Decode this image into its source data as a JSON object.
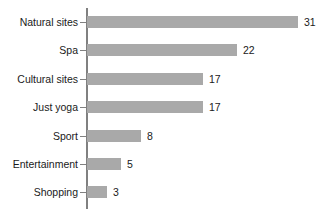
{
  "chart_data": {
    "type": "bar",
    "orientation": "horizontal",
    "title": "",
    "subtitle": "",
    "xlabel": "",
    "ylabel": "",
    "categories": [
      "Natural sites",
      "Spa",
      "Cultural sites",
      "Just yoga",
      "Sport",
      "Entertainment",
      "Shopping"
    ],
    "values": [
      31,
      22,
      17,
      17,
      8,
      5,
      3
    ],
    "value_labels": [
      "31",
      "22",
      "17",
      "17",
      "8",
      "5",
      "3"
    ],
    "xlim": [
      0,
      31
    ],
    "ylim": null,
    "grid": false,
    "legend": null,
    "legend_position": "none",
    "bar_color": "#a9a9a9",
    "axis_color": "#808080",
    "text_color": "#1a1a1a",
    "background": "#ffffff",
    "tick_labels_x": [],
    "tick_labels_y": [
      "Natural sites",
      "Spa",
      "Cultural sites",
      "Just yoga",
      "Sport",
      "Entertainment",
      "Shopping"
    ],
    "annotations": []
  },
  "layout": {
    "axis_x_px": 87,
    "plot_left_px": 87,
    "plot_right_px": 298,
    "row_tops_px": [
      14,
      42,
      71,
      99,
      128,
      156,
      184
    ],
    "bar_height_px": 12,
    "px_per_unit": 6.8
  }
}
